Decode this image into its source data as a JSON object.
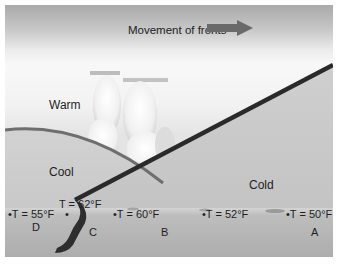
{
  "diagram": {
    "title": "Movement of fronts",
    "direction_arrow": "right-arrow",
    "air_masses": {
      "warm": "Warm",
      "cool": "Cool",
      "cold": "Cold"
    },
    "stations": [
      {
        "id": "D",
        "label": "D",
        "temp": "T = 55°F"
      },
      {
        "id": "C",
        "label": "C",
        "temp": "T = 62°F"
      },
      {
        "id": "B",
        "label": "B",
        "temp": "T = 60°F"
      },
      {
        "id": "",
        "label": "",
        "temp": "T = 52°F"
      },
      {
        "id": "A",
        "label": "A",
        "temp": "T = 50°F"
      }
    ],
    "colors": {
      "cold_front_line": "#2a2a2a",
      "warm_boundary_line": "#6e6e6e",
      "arrow": "#6a6a6a",
      "ground": "#b4b4b4"
    }
  }
}
